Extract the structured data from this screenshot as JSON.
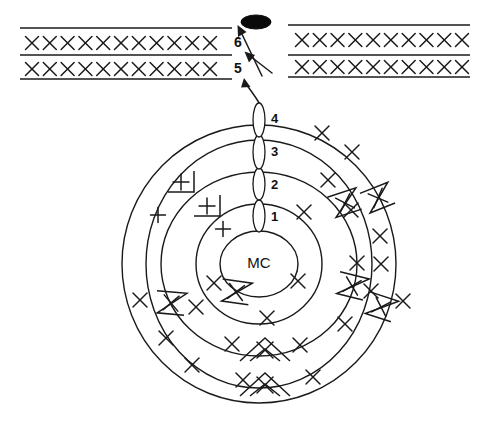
{
  "figure": {
    "center_label": "MC",
    "background_color": "#ffffff",
    "line_color": "#1a1a1a"
  },
  "center": {
    "cx": 259,
    "cy": 264,
    "rx": 39,
    "ry": 33,
    "label": "MC"
  },
  "rings": [
    {
      "name": "ring-1-inner-core",
      "cx": 259,
      "cy": 264,
      "rx": 39,
      "ry": 33
    },
    {
      "name": "ring-2-layer-one",
      "cx": 259,
      "cy": 264,
      "rx": 63,
      "ry": 60
    },
    {
      "name": "ring-3-layer-two",
      "cx": 259,
      "cy": 264,
      "rx": 98,
      "ry": 92
    },
    {
      "name": "ring-4-layer-three",
      "cx": 259,
      "cy": 264,
      "rx": 113,
      "ry": 124
    },
    {
      "name": "ring-5-layer-outer",
      "cx": 259,
      "cy": 264,
      "rx": 137,
      "ry": 139
    }
  ],
  "gates": [
    {
      "id": "gate-1",
      "label": "1",
      "cx": 259,
      "cy": 216,
      "rx": 6,
      "ry": 16,
      "label_x": 271,
      "label_y": 218
    },
    {
      "id": "gate-2",
      "label": "2",
      "cx": 259,
      "cy": 184,
      "rx": 6,
      "ry": 16,
      "label_x": 271,
      "label_y": 186
    },
    {
      "id": "gate-3",
      "label": "3",
      "cx": 259,
      "cy": 152,
      "rx": 6,
      "ry": 17,
      "label_x": 271,
      "label_y": 153
    },
    {
      "id": "gate-4",
      "label": "4",
      "cx": 259,
      "cy": 120,
      "rx": 6,
      "ry": 17,
      "label_x": 271,
      "label_y": 120
    }
  ],
  "bands": {
    "left_edge": 20,
    "right_edge": 470,
    "gap_left": 232,
    "gap_right": 288,
    "labels": [
      {
        "id": "band-6",
        "label": "6",
        "x": 238,
        "y": 43
      },
      {
        "id": "band-5",
        "label": "5",
        "x": 238,
        "y": 69
      }
    ],
    "rows": [
      {
        "id": "band-row-6",
        "y_top": 28,
        "y_bottom": 55,
        "mark_y": 43,
        "left_count": 11,
        "right_count": 10
      },
      {
        "id": "band-row-5",
        "y_top": 55,
        "y_bottom": 79,
        "mark_y": 69,
        "left_count": 11,
        "right_count": 10
      }
    ]
  },
  "blob": {
    "cx": 256,
    "cy": 22,
    "rx": 15,
    "ry": 7,
    "name": "filled-ellipse-marker"
  },
  "x_marks": [
    {
      "x": 322,
      "y": 133
    },
    {
      "x": 352,
      "y": 152
    },
    {
      "x": 328,
      "y": 180
    },
    {
      "x": 351,
      "y": 210
    },
    {
      "x": 380,
      "y": 236
    },
    {
      "x": 381,
      "y": 264
    },
    {
      "x": 357,
      "y": 263
    },
    {
      "x": 304,
      "y": 212
    },
    {
      "x": 267,
      "y": 318
    },
    {
      "x": 214,
      "y": 283
    },
    {
      "x": 298,
      "y": 281
    },
    {
      "x": 196,
      "y": 307
    },
    {
      "x": 166,
      "y": 338
    },
    {
      "x": 192,
      "y": 365
    },
    {
      "x": 232,
      "y": 344
    },
    {
      "x": 300,
      "y": 345
    },
    {
      "x": 345,
      "y": 324
    },
    {
      "x": 243,
      "y": 380
    },
    {
      "x": 313,
      "y": 377
    },
    {
      "x": 140,
      "y": 300
    },
    {
      "x": 403,
      "y": 301
    },
    {
      "x": 371,
      "y": 291
    }
  ],
  "plus_marks": [
    {
      "x": 158,
      "y": 215
    },
    {
      "x": 223,
      "y": 229
    }
  ],
  "plus_bracket_marks": [
    {
      "x": 181,
      "y": 182
    },
    {
      "x": 207,
      "y": 206
    }
  ],
  "x_bracket_marks": [
    {
      "x": 378,
      "y": 198,
      "rot": -22
    },
    {
      "x": 345,
      "y": 203,
      "rot": -18
    },
    {
      "x": 236,
      "y": 292,
      "rot": 8
    },
    {
      "x": 171,
      "y": 303,
      "rot": 5
    },
    {
      "x": 352,
      "y": 286,
      "rot": 14
    },
    {
      "x": 381,
      "y": 307,
      "rot": 18
    }
  ],
  "chevron_x_marks": [
    {
      "x": 265,
      "y": 350
    },
    {
      "x": 265,
      "y": 385
    }
  ],
  "arrows": [
    {
      "id": "arrow-outer-to-band5",
      "name": "curved-arrow-to-band-5"
    },
    {
      "id": "arrow-diagonal-band5",
      "name": "diagonal-arrow-to-band-5"
    },
    {
      "id": "arrow-diagonal-band6",
      "name": "diagonal-arrow-to-band-6"
    }
  ]
}
